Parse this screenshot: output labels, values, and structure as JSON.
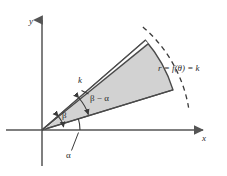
{
  "figure": {
    "background_color": "#ffffff",
    "fill_color": "#d2d2d2",
    "stroke_color": "#4a4a4a",
    "axis_color": "#555555",
    "labels": {
      "y_axis": "y",
      "x_axis": "x",
      "alpha": "α",
      "beta": "β",
      "beta_minus_alpha": "β − α",
      "radius": "k",
      "curve_equation_r": "r",
      "curve_equation_eq1": " = ",
      "curve_equation_f": "f",
      "curve_equation_theta": "(θ)",
      "curve_equation_eq2": " = ",
      "curve_equation_k": "k",
      "curve_equation_full": "r = f(θ) = k"
    },
    "geometry": {
      "origin_x": 42,
      "origin_y": 130,
      "radius_k": 137,
      "angle_alpha_deg": 17,
      "angle_beta_deg": 41,
      "y_axis_top": 18,
      "x_axis_right": 205
    }
  }
}
